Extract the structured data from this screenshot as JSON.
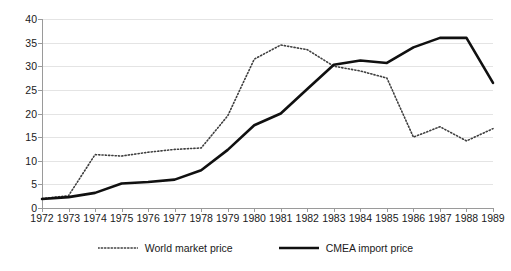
{
  "chart_data": {
    "type": "line",
    "title": "",
    "xlabel": "",
    "ylabel": "",
    "categories": [
      "1972",
      "1973",
      "1974",
      "1975",
      "1976",
      "1977",
      "1978",
      "1979",
      "1980",
      "1981",
      "1982",
      "1983",
      "1984",
      "1985",
      "1986",
      "1987",
      "1988",
      "1989"
    ],
    "xlim": [
      1972,
      1989
    ],
    "ylim": [
      0,
      40
    ],
    "yticks": [
      0,
      5,
      10,
      15,
      20,
      25,
      30,
      35,
      40
    ],
    "grid": true,
    "legend_position": "bottom",
    "series": [
      {
        "name": "World market price",
        "style": "dotted",
        "color": "#3f3f3f",
        "values": [
          2.0,
          2.6,
          11.3,
          11.0,
          11.8,
          12.4,
          12.7,
          19.5,
          31.5,
          34.5,
          33.5,
          30.0,
          29.0,
          27.5,
          15.0,
          17.2,
          14.2,
          16.8
        ]
      },
      {
        "name": "CMEA import price",
        "style": "solid",
        "color": "#101010",
        "values": [
          1.9,
          2.3,
          3.2,
          5.2,
          5.5,
          6.0,
          8.0,
          12.3,
          17.5,
          20.0,
          25.2,
          30.3,
          31.2,
          30.7,
          34.0,
          36.0,
          36.0,
          26.5
        ]
      }
    ]
  },
  "legend": {
    "entries": [
      {
        "label": "World market price",
        "icon": "dotted-line-icon"
      },
      {
        "label": "CMEA import price",
        "icon": "solid-line-icon"
      }
    ]
  }
}
